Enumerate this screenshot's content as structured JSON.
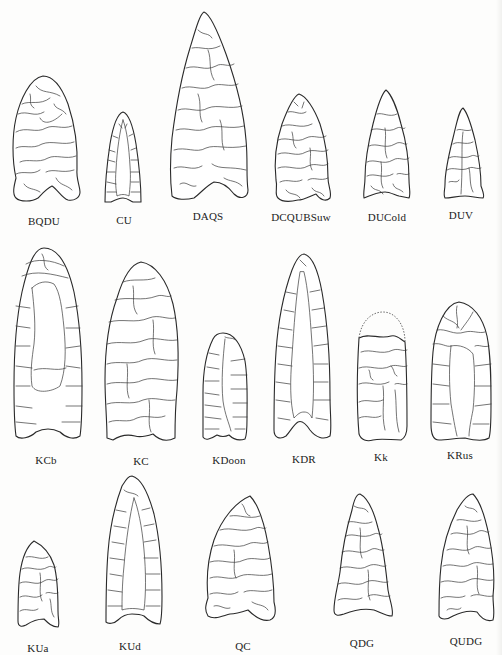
{
  "figure": {
    "rows": [
      {
        "items": [
          {
            "label": "BQDU"
          },
          {
            "label": "CU"
          },
          {
            "label": "DAQS"
          },
          {
            "label": "DCQUBSuw"
          },
          {
            "label": "DUCold"
          },
          {
            "label": "DUV"
          }
        ]
      },
      {
        "items": [
          {
            "label": "KCb"
          },
          {
            "label": "KC"
          },
          {
            "label": "KDoon"
          },
          {
            "label": "KDR"
          },
          {
            "label": "Kk"
          },
          {
            "label": "KRus"
          }
        ]
      },
      {
        "items": [
          {
            "label": "KUa"
          },
          {
            "label": "KUd"
          },
          {
            "label": "QC"
          },
          {
            "label": "QDG"
          },
          {
            "label": "QUDG"
          }
        ]
      }
    ]
  }
}
